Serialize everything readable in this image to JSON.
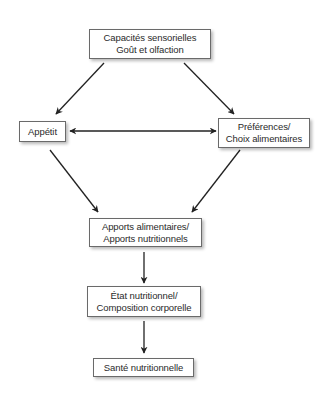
{
  "diagram": {
    "type": "flowchart",
    "nodes": [
      {
        "id": "sensory",
        "lines": [
          "Capacités sensorielles",
          "Goût et olfaction"
        ]
      },
      {
        "id": "appetite",
        "lines": [
          "Appétit"
        ]
      },
      {
        "id": "preferences",
        "lines": [
          "Préférences/",
          "Choix alimentaires"
        ]
      },
      {
        "id": "intake",
        "lines": [
          "Apports alimentaires/",
          "Apports nutritionnels"
        ]
      },
      {
        "id": "status",
        "lines": [
          "État nutritionnel/",
          "Composition corporelle"
        ]
      },
      {
        "id": "health",
        "lines": [
          "Santé nutritionnelle"
        ]
      }
    ],
    "edges": [
      {
        "from": "sensory",
        "to": "appetite",
        "direction": "forward"
      },
      {
        "from": "sensory",
        "to": "preferences",
        "direction": "forward"
      },
      {
        "from": "appetite",
        "to": "preferences",
        "direction": "bidirectional"
      },
      {
        "from": "appetite",
        "to": "intake",
        "direction": "forward"
      },
      {
        "from": "preferences",
        "to": "intake",
        "direction": "forward"
      },
      {
        "from": "intake",
        "to": "status",
        "direction": "forward"
      },
      {
        "from": "status",
        "to": "health",
        "direction": "forward"
      }
    ],
    "colors": {
      "line": "#222222",
      "border": "#6a6a6a",
      "background": "#ffffff"
    }
  }
}
